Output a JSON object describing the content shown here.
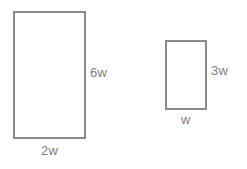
{
  "diagram": {
    "background_color": "#ffffff",
    "stroke_color": "#8a8a8a",
    "label_color": "#7d7d7d",
    "shapes": [
      {
        "name": "large-rectangle",
        "type": "rectangle",
        "width_label": "2w",
        "height_label": "6w"
      },
      {
        "name": "small-rectangle",
        "type": "rectangle",
        "width_label": "w",
        "height_label": "3w"
      }
    ]
  }
}
